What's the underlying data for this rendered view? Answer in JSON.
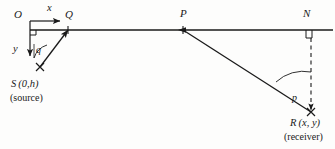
{
  "figure": {
    "width": 335,
    "height": 149,
    "background_color": "#fdfdfc",
    "stroke_color": "#1a1a1a"
  },
  "axes": {
    "origin_label": "O",
    "x_label": "x",
    "y_label": "y",
    "right_angle_marker": "right-angle-square"
  },
  "points": {
    "O": {
      "label": "O",
      "x": 30,
      "y": 30
    },
    "Q": {
      "label": "Q",
      "x": 68,
      "y": 30
    },
    "P": {
      "label": "P",
      "x": 183,
      "y": 30
    },
    "N": {
      "label": "N",
      "x": 311,
      "y": 30
    },
    "S": {
      "label": "S",
      "coords": "(0,h)",
      "note": "(source)",
      "x": 40,
      "y": 67
    },
    "R": {
      "label": "R",
      "coords": "(x, y)",
      "note": "(receiver)",
      "x": 311,
      "y": 112
    }
  },
  "angles": {
    "at_source": {
      "label": "q",
      "description": "takeoff-angle-at-source"
    },
    "at_receiver": {
      "label": "p",
      "description": "incidence-angle-at-receiver"
    }
  },
  "segments": {
    "interface": "horizontal-interface-line",
    "source_ray": "S-to-Q-ray",
    "receiver_ray": "P-to-R-ray",
    "normal": "N-to-R-dashed-normal"
  }
}
